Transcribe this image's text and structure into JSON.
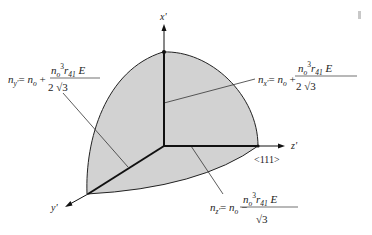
{
  "figure": {
    "fill_color": "#d2d2d2",
    "line_color": "#111111"
  },
  "axes": {
    "x_label": "x'",
    "y_label": "y'",
    "z_label": "z'",
    "z_direction": "<111>"
  },
  "equations": {
    "ny": {
      "lhs": "n",
      "lhs_sub": "y'",
      "equals": "= ",
      "rhs": "n",
      "rhs_sub": "o",
      "op": " +",
      "num_n": "n",
      "num_n_sub": "o",
      "num_sup": "3",
      "num_r": "r",
      "num_r_sub": "41",
      "num_e": " E",
      "den": "2 √3"
    },
    "nx": {
      "lhs": "n",
      "lhs_sub": "x'",
      "equals": "= ",
      "rhs": "n",
      "rhs_sub": "o",
      "op": " +",
      "num_n": "n",
      "num_n_sub": "o",
      "num_sup": "3",
      "num_r": "r",
      "num_r_sub": "41",
      "num_e": " E",
      "den": "2 √3"
    },
    "nz": {
      "lhs": "n",
      "lhs_sub": "z'",
      "equals": "= ",
      "rhs": "n",
      "rhs_sub": "o",
      "op": " −",
      "num_n": "n",
      "num_n_sub": "o",
      "num_sup": "3",
      "num_r": "r",
      "num_r_sub": "41",
      "num_e": " E",
      "den": "√3"
    }
  }
}
